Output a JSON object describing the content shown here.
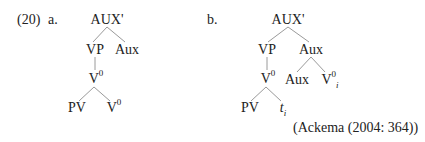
{
  "example": {
    "number": "(20)",
    "a_label": "a.",
    "b_label": "b."
  },
  "tree_a": {
    "root": "AUX'",
    "vp": "VP",
    "aux": "Aux",
    "v0": "V",
    "v0_sup": "0",
    "pv": "PV",
    "v0_leaf": "V",
    "v0_leaf_sup": "0"
  },
  "tree_b": {
    "root": "AUX'",
    "vp": "VP",
    "aux": "Aux",
    "v0": "V",
    "v0_sup": "0",
    "pv": "PV",
    "trace": "t",
    "trace_index": "i",
    "aux_leaf": "Aux",
    "v0_leaf": "V",
    "v0_leaf_sup": "0",
    "v0_leaf_index": "i"
  },
  "citation": "(Ackema (2004: 364))",
  "colors": {
    "text": "#222222",
    "edges": "#9a9a9a",
    "background": "#ffffff"
  }
}
